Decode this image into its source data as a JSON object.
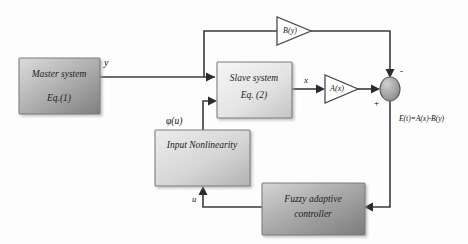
{
  "diagram": {
    "blocks": [
      {
        "id": "master",
        "name": "master-system-block",
        "line1": "Master system",
        "line2": "Eq.(1)",
        "fill_light": "#d7d7d7",
        "fill_dark": "#8e8e8e"
      },
      {
        "id": "slave",
        "name": "slave-system-block",
        "line1": "Slave system",
        "line2": "Eq. (2)",
        "fill_light": "#f2f2f2",
        "fill_dark": "#c9c9c9"
      },
      {
        "id": "nonlinearity",
        "name": "input-nonlinearity-block",
        "line1": "Input Nonlinearity",
        "line2": "",
        "fill_light": "#e6e6e6",
        "fill_dark": "#bcbcbc"
      },
      {
        "id": "controller",
        "name": "fuzzy-adaptive-controller-block",
        "line1": "Fuzzy adaptive",
        "line2": "controller",
        "fill_light": "#cfcfcf",
        "fill_dark": "#8a8a8a"
      }
    ],
    "gains": [
      {
        "id": "gain_b",
        "name": "gain-block-by",
        "label": "B(y)"
      },
      {
        "id": "gain_a",
        "name": "gain-block-ax",
        "label": "A(x)"
      }
    ],
    "summing_junction": {
      "name": "summing-junction",
      "sign_top": "-",
      "sign_left": "+",
      "fill_light": "#c5c5c5",
      "fill_dark": "#888888"
    },
    "signals": [
      {
        "id": "sig_y",
        "name": "signal-label-y",
        "label": "y"
      },
      {
        "id": "sig_x",
        "name": "signal-label-x",
        "label": "x"
      },
      {
        "id": "sig_phi",
        "name": "signal-label-phi-u",
        "label": "φ(u)"
      },
      {
        "id": "sig_u",
        "name": "signal-label-u",
        "label": "u"
      },
      {
        "id": "sig_e",
        "name": "signal-label-error",
        "label": "E(t)=A(x)-B(y)"
      }
    ]
  }
}
